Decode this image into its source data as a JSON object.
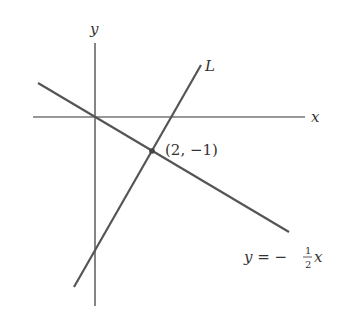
{
  "diagram": {
    "axes": {
      "x_label": "x",
      "y_label": "y"
    },
    "lines": [
      {
        "name": "L",
        "label": "L"
      },
      {
        "name": "y=-1/2 x",
        "label_lhs": "y = −",
        "label_num": "1",
        "label_den": "2",
        "label_var": "x"
      }
    ],
    "point": {
      "label": "(2, −1)",
      "coords": [
        2,
        -1
      ]
    },
    "colors": {
      "axis": "#333333",
      "line": "#555555"
    }
  }
}
